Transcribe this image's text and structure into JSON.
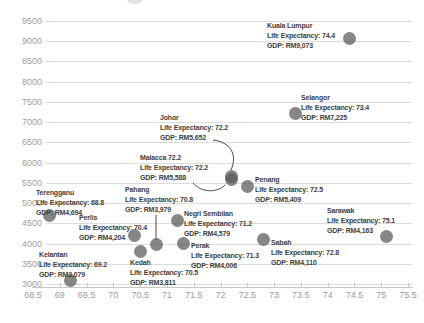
{
  "chart_data": {
    "type": "scatter",
    "title": "",
    "xlabel": "",
    "ylabel": "",
    "legend": "none",
    "grid": "horizontal",
    "x_axis": {
      "min": 68.5,
      "max": 75.5,
      "ticks": [
        {
          "v": 68.5,
          "label": "68.5"
        },
        {
          "v": 69,
          "label": "69"
        },
        {
          "v": 69.5,
          "label": "69.5"
        },
        {
          "v": 70,
          "label": "70"
        },
        {
          "v": 70.5,
          "label": "70.5"
        },
        {
          "v": 71,
          "label": "71"
        },
        {
          "v": 71.5,
          "label": "71.5"
        },
        {
          "v": 72,
          "label": "72"
        },
        {
          "v": 72.5,
          "label": "72.5"
        },
        {
          "v": 73,
          "label": "73"
        },
        {
          "v": 73.5,
          "label": "73.5"
        },
        {
          "v": 74,
          "label": "74"
        },
        {
          "v": 74.5,
          "label": "74.5"
        },
        {
          "v": 75,
          "label": "75"
        },
        {
          "v": 75.5,
          "label": "75.5"
        }
      ]
    },
    "y_axis": {
      "min": 3000,
      "max": 9500,
      "ticks": [
        {
          "v": 3000,
          "label": "3000"
        },
        {
          "v": 3500,
          "label": "3500"
        },
        {
          "v": 4000,
          "label": "4000"
        },
        {
          "v": 4500,
          "label": "4500"
        },
        {
          "v": 5000,
          "label": "5000"
        },
        {
          "v": 5500,
          "label": "5500"
        },
        {
          "v": 6000,
          "label": "6000"
        },
        {
          "v": 6500,
          "label": "6500"
        },
        {
          "v": 7000,
          "label": "7000"
        },
        {
          "v": 7500,
          "label": "7500"
        },
        {
          "v": 8000,
          "label": "8000"
        },
        {
          "v": 8500,
          "label": "8500"
        },
        {
          "v": 9000,
          "label": "9000"
        },
        {
          "v": 9500,
          "label": "9500"
        }
      ]
    },
    "colors": {
      "point": "rgba(88,88,88,0.72)",
      "grid": "#dcdcdc",
      "axis_line": "#c8c8c8",
      "axis_text": "#9d9d9d",
      "annotation_text": "#3e3e3e",
      "connector": "#4a4a4a"
    },
    "points": [
      {
        "id": "kuala-lumpur",
        "title": "Kuala Lumpur",
        "life_expectancy": 74.4,
        "gdp": 9073,
        "le_text": "Life Expectancy: 74.4",
        "gdp_text": "GDP: RM9,073",
        "label_x": 267,
        "label_y": 21
      },
      {
        "id": "selangor",
        "title": "Selangor",
        "life_expectancy": 73.4,
        "gdp": 7225,
        "le_text": "Life Expectancy: 73.4",
        "gdp_text": "GDP: RM7,225",
        "label_x": 301,
        "label_y": 93
      },
      {
        "id": "johor",
        "title": "Johor",
        "life_expectancy": 72.2,
        "gdp": 5652,
        "le_text": "Life Expectancy: 72.2",
        "gdp_text": "GDP: RM5,652",
        "label_x": 160,
        "label_y": 113
      },
      {
        "id": "malacca",
        "title": "Malacca 72.2",
        "life_expectancy": 72.2,
        "gdp": 5588,
        "le_text": "Life Expectancy: 72.2",
        "gdp_text": "GDP: RM5,588",
        "label_x": 140,
        "label_y": 153
      },
      {
        "id": "penang",
        "title": "Penang",
        "life_expectancy": 72.5,
        "gdp": 5409,
        "le_text": "Life Expectancy: 72.5",
        "gdp_text": "GDP: RM5,409",
        "label_x": 255,
        "label_y": 175
      },
      {
        "id": "terengganu",
        "title": "Terengganu",
        "life_expectancy": 68.8,
        "gdp": 4694,
        "le_text": "Life Expectancy: 68.8",
        "gdp_text": "GDP: RM4,694",
        "label_x": 36,
        "label_y": 188
      },
      {
        "id": "perlis",
        "title": "Perlis",
        "life_expectancy": 70.4,
        "gdp": 4204,
        "le_text": "Life Expectancy: 70.4",
        "gdp_text": "GDP: RM4,204",
        "label_x": 79,
        "label_y": 213
      },
      {
        "id": "pahang",
        "title": "Pahang",
        "life_expectancy": 70.8,
        "gdp": 3979,
        "le_text": "Life Expectancy: 70.8",
        "gdp_text": "GDP: RM3,979",
        "label_x": 125,
        "label_y": 185
      },
      {
        "id": "negri-sembilan",
        "title": "Negri Sembilan",
        "life_expectancy": 71.2,
        "gdp": 4579,
        "le_text": "Life Expectancy: 71.2",
        "gdp_text": "GDP: RM4,579",
        "label_x": 184,
        "label_y": 209
      },
      {
        "id": "perak",
        "title": "Perak",
        "life_expectancy": 71.3,
        "gdp": 4006,
        "le_text": "Life Expectancy: 71.3",
        "gdp_text": "GDP: RM4,006",
        "label_x": 191,
        "label_y": 241
      },
      {
        "id": "kedah",
        "title": "Kedah",
        "life_expectancy": 70.5,
        "gdp": 3811,
        "le_text": "Life Expectancy: 70.5",
        "gdp_text": "GDP: RM3,811",
        "label_x": 130,
        "label_y": 258
      },
      {
        "id": "kelantan",
        "title": "Kelantan",
        "life_expectancy": 69.2,
        "gdp": 3079,
        "le_text": "Life Expectancy: 69.2",
        "gdp_text": "GDP: RM3,079",
        "label_x": 39,
        "label_y": 250
      },
      {
        "id": "sabah",
        "title": "Sabah",
        "life_expectancy": 72.8,
        "gdp": 4110,
        "le_text": "Life Expectancy: 72.8",
        "gdp_text": "GDP: RM4,110",
        "label_x": 271,
        "label_y": 238
      },
      {
        "id": "sarawak",
        "title": "Sarawak",
        "life_expectancy": 75.1,
        "gdp": 4163,
        "le_text": "Life Expectancy: 75.1",
        "gdp_text": "GDP: RM4,163",
        "label_x": 327,
        "label_y": 206
      }
    ],
    "connectors": [
      {
        "from": "johor",
        "path": "M213,140 C230,142 238,154 231,170"
      },
      {
        "from": "malacca",
        "path": "M193,183 C202,193 217,193 225,185"
      },
      {
        "from": "pahang",
        "path": "M156,215 L156,240"
      }
    ]
  }
}
